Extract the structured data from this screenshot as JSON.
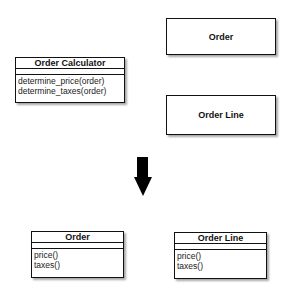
{
  "before": {
    "order_calculator": {
      "name": "Order Calculator",
      "attributes": [],
      "operations": [
        "determine_price(order)",
        "determine_taxes(order)"
      ]
    },
    "order": {
      "name": "Order"
    },
    "order_line": {
      "name": "Order Line"
    }
  },
  "transition": {
    "icon": "down-arrow-icon"
  },
  "after": {
    "order": {
      "name": "Order",
      "attributes": [],
      "operations": [
        "price()",
        "taxes()"
      ]
    },
    "order_line": {
      "name": "Order Line",
      "attributes": [],
      "operations": [
        "price()",
        "taxes()"
      ]
    }
  }
}
